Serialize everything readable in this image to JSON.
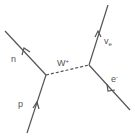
{
  "diagram": {
    "type": "feynman",
    "particles": {
      "n": "n",
      "p": "p",
      "w": "W",
      "w_sup": "+",
      "nu": "v",
      "nu_sub": "e",
      "e": "e",
      "e_sup": "-"
    },
    "colors": {
      "line": "#555555",
      "background": "#ffffff"
    }
  }
}
